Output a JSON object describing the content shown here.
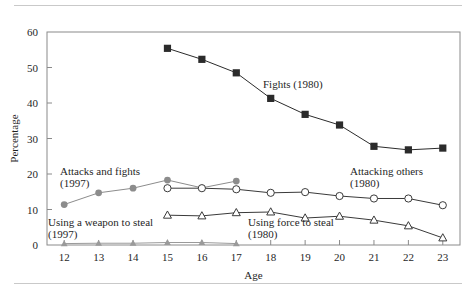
{
  "figure": {
    "kind": "line-chart-figure",
    "has_top_rule": true,
    "has_bottom_rule": true
  },
  "axes": {
    "y_title": "Percentage",
    "x_title": "Age",
    "y_ticks": [
      "0",
      "10",
      "20",
      "30",
      "40",
      "50",
      "60"
    ],
    "x_ticks": [
      "12",
      "13",
      "14",
      "15",
      "16",
      "17",
      "18",
      "19",
      "20",
      "21",
      "22",
      "23"
    ]
  },
  "labels": {
    "fights": {
      "line1": "Fights (1980)",
      "line2": ""
    },
    "attacks_and_fights": {
      "line1": "Attacks and fights",
      "line2": "(1997)"
    },
    "attacking_others": {
      "line1": "Attacking others",
      "line2": "(1980)"
    },
    "using_force_to_steal": {
      "line1": "Using force to steal",
      "line2": "(1980)"
    },
    "using_weapon_to_steal": {
      "line1": "Using a weapon to steal",
      "line2": "(1997)"
    }
  },
  "colors": {
    "fights": "#2b2b2b",
    "attacks_and_fights": "#8c8c8c",
    "attacking_others": "#3a3a3a",
    "using_force_to_steal": "#3a3a3a",
    "using_weapon_to_steal": "#9a9a9a",
    "axis": "#8a8a8a",
    "rule": "#c9c9c9",
    "text": "#1f1f1f"
  },
  "chart_data": {
    "type": "line",
    "title": "",
    "xlabel": "Age",
    "ylabel": "Percentage",
    "xlim": [
      11.5,
      23.5
    ],
    "ylim": [
      0,
      60
    ],
    "grid": false,
    "legend": "inline-annotations",
    "x": [
      12,
      13,
      14,
      15,
      16,
      17,
      18,
      19,
      20,
      21,
      22,
      23
    ],
    "series": [
      {
        "name": "Fights (1980)",
        "marker": "filled-square",
        "color": "#2b2b2b",
        "x": [
          15,
          16,
          17,
          18,
          19,
          20,
          21,
          22,
          23
        ],
        "values": [
          55.4,
          52.3,
          48.5,
          41.3,
          36.8,
          33.8,
          27.8,
          26.8,
          27.3
        ]
      },
      {
        "name": "Attacks and fights (1997)",
        "marker": "filled-circle",
        "color": "#8c8c8c",
        "x": [
          12,
          13,
          14,
          15,
          16,
          17
        ],
        "values": [
          11.4,
          14.7,
          16.0,
          18.3,
          16.1,
          18.0
        ]
      },
      {
        "name": "Attacking others (1980)",
        "marker": "open-circle",
        "color": "#3a3a3a",
        "x": [
          15,
          16,
          17,
          18,
          19,
          20,
          21,
          22,
          23
        ],
        "values": [
          16.0,
          16.0,
          15.7,
          14.7,
          14.9,
          13.8,
          13.1,
          13.1,
          11.2
        ]
      },
      {
        "name": "Using force to steal (1980)",
        "marker": "open-triangle",
        "color": "#3a3a3a",
        "x": [
          15,
          16,
          17,
          18,
          19,
          20,
          21,
          22,
          23
        ],
        "values": [
          8.4,
          8.2,
          9.1,
          9.3,
          7.6,
          8.1,
          7.0,
          5.4,
          2.0
        ]
      },
      {
        "name": "Using a weapon to steal (1997)",
        "marker": "filled-triangle",
        "color": "#9a9a9a",
        "x": [
          12,
          13,
          14,
          15,
          16,
          17
        ],
        "values": [
          0.4,
          0.5,
          0.5,
          0.7,
          0.7,
          0.4
        ]
      }
    ]
  }
}
